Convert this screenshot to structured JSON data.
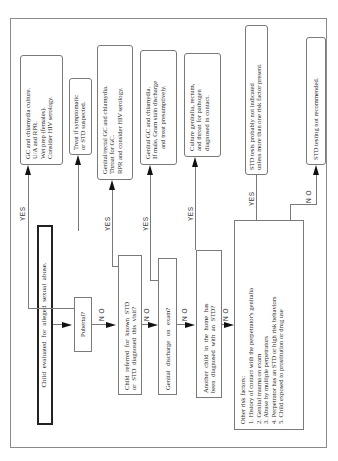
{
  "diagram": {
    "start": "Child evaluated for alleged sexual abuse.",
    "questions": {
      "pubertal": "Pubertal?",
      "referred": [
        "Child referred for known STD",
        "or STD diagnosed this visit?"
      ],
      "discharge": "Genital discharge on exam?",
      "another_child": [
        "Another child in the home has",
        "been diagnosed with an STD?"
      ]
    },
    "risk_factors": {
      "title": "Other risk factors:",
      "items": [
        "1.  History of contact with the perpetrator's genitalia",
        "2.  Genital trauma on exam",
        "3.  Abuse by multiple perpetrators",
        "4.  Perpetrator has an STD or high risk behaviors",
        "5.  Child exposed to prostitution or drug use"
      ]
    },
    "results": {
      "pubertal_yes": [
        "GC and chlamydia culture.",
        "U/A and RPR.",
        "Wet prep (females).",
        "Consider HIV serology."
      ],
      "treat": [
        "Treat if symptomatic",
        "or STD suspected."
      ],
      "referred_yes": [
        "Genital/rectal GC and chlamydia.",
        "Throat for GC.",
        "RPR and consider HIV serology."
      ],
      "discharge_yes": [
        "Genital GC and chlamydia.",
        "If male, Gram stain discharge",
        "and treat presumptively."
      ],
      "another_yes": [
        "Culture genitalia, rectum,",
        "and throat for pathogen",
        "diagnosed in contact."
      ],
      "risk_yes": [
        "STD tests probably not indicated",
        "unless more than one risk factor present."
      ],
      "risk_no": "STD testing not recommended."
    },
    "labels": {
      "yes": "YES",
      "no": "N O"
    }
  }
}
